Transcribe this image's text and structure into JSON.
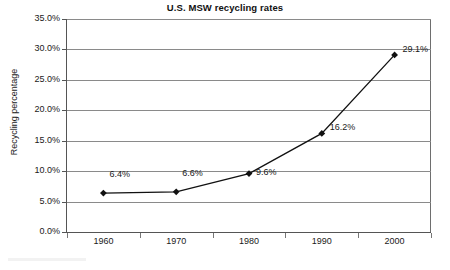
{
  "chart_data": {
    "type": "line",
    "title": "U.S. MSW recycling rates",
    "xlabel": "Year",
    "ylabel": "Recycling percentage",
    "categories": [
      "1960",
      "1970",
      "1980",
      "1990",
      "2000"
    ],
    "values": [
      6.4,
      6.6,
      9.6,
      16.2,
      29.1
    ],
    "point_labels": [
      "6.4%",
      "6.6%",
      "9.6%",
      "16.2%",
      "29.1%"
    ],
    "ylim": [
      0,
      35
    ],
    "ytick_values": [
      0,
      5,
      10,
      15,
      20,
      25,
      30,
      35
    ],
    "ytick_labels": [
      "0.0%",
      "5.0%",
      "10.0%",
      "15.0%",
      "20.0%",
      "25.0%",
      "30.0%",
      "35.0%"
    ],
    "grid": "horizontal",
    "legend": "none",
    "marker": "diamond",
    "series_color": "#111111",
    "grid_color": "#8a8a8a",
    "axis_color": "#555555",
    "background": "#ffffff"
  }
}
